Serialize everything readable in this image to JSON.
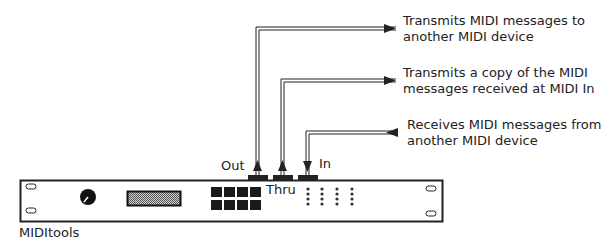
{
  "device": {
    "name": "MIDItools",
    "ports": [
      {
        "id": "out",
        "label": "Out",
        "direction": "output"
      },
      {
        "id": "thru",
        "label": "Thru",
        "direction": "output"
      },
      {
        "id": "in",
        "label": "In",
        "direction": "input"
      }
    ]
  },
  "callouts": [
    {
      "port": "out",
      "line1": "Transmits MIDI messages to",
      "line2": "another MIDI device"
    },
    {
      "port": "thru",
      "line1": "Transmits a copy of the MIDI",
      "line2": "messages received at MIDI In"
    },
    {
      "port": "in",
      "line1": "Receives MIDI messages from",
      "line2": "another MIDI device"
    }
  ]
}
